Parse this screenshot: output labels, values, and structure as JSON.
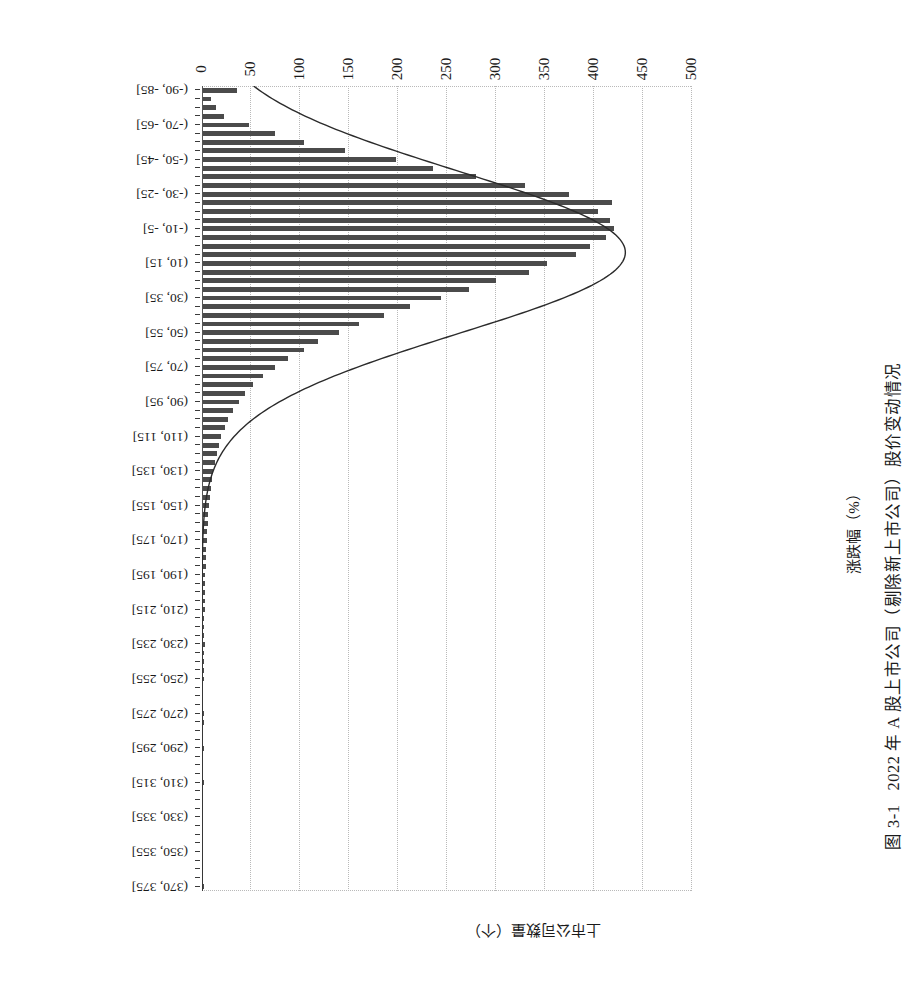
{
  "caption": {
    "number": "图 3-1",
    "text": "2022 年 A 股上市公司（剔除新上市公司）股价变动情况"
  },
  "axes": {
    "value_axis_title": "上市公司数量（个）",
    "category_axis_title": "涨跌幅（%）"
  },
  "chart_data": {
    "type": "bar",
    "orientation": "horizontal-rotated-180",
    "title": "2022 年 A 股上市公司（剔除新上市公司）股价变动情况",
    "xlabel": "涨跌幅（%）",
    "ylabel": "上市公司数量（个）",
    "ylim": [
      0,
      500
    ],
    "yticks": [
      0,
      50,
      100,
      150,
      200,
      250,
      300,
      350,
      400,
      450,
      500
    ],
    "grid": true,
    "legend": null,
    "overlay_curve": "normal distribution fit",
    "categories": [
      "(-90, -85]",
      "(-85, -80]",
      "(-80, -75]",
      "(-75, -70]",
      "(-70, -65]",
      "(-65, -60]",
      "(-60, -55]",
      "(-55, -50]",
      "(-50, -45]",
      "(-45, -40]",
      "(-40, -35]",
      "(-35, -30]",
      "(-30, -25]",
      "(-25, -20]",
      "(-20, -15]",
      "(-15, -10]",
      "(-10, -5]",
      "(-5, 0]",
      "(0, 5]",
      "(5, 10]",
      "(10, 15]",
      "(15, 20]",
      "(20, 25]",
      "(25, 30]",
      "(30, 35]",
      "(35, 40]",
      "(40, 45]",
      "(45, 50]",
      "(50, 55]",
      "(55, 60]",
      "(60, 65]",
      "(65, 70]",
      "(70, 75]",
      "(75, 80]",
      "(80, 85]",
      "(85, 90]",
      "(90, 95]",
      "(95, 100]",
      "(100, 105]",
      "(105, 110]",
      "(110, 115]",
      "(115, 120]",
      "(120, 125]",
      "(125, 130]",
      "(130, 135]",
      "(135, 140]",
      "(140, 145]",
      "(145, 150]",
      "(150, 155]",
      "(155, 160]",
      "(160, 165]",
      "(165, 170]",
      "(170, 175]",
      "(175, 180]",
      "(180, 185]",
      "(185, 190]",
      "(190, 195]",
      "(195, 200]",
      "(200, 205]",
      "(205, 210]",
      "(210, 215]",
      "(215, 220]",
      "(220, 225]",
      "(225, 230]",
      "(230, 235]",
      "(235, 240]",
      "(240, 245]",
      "(245, 250]",
      "(250, 255]",
      "(255, 260]",
      "(260, 265]",
      "(265, 270]",
      "(270, 275]",
      "(275, 280]",
      "(280, 285]",
      "(285, 290]",
      "(290, 295]",
      "(295, 300]",
      "(300, 305]",
      "(305, 310]",
      "(310, 315]",
      "(315, 320]",
      "(320, 325]",
      "(325, 330]",
      "(330, 335]",
      "(335, 340]",
      "(340, 345]",
      "(345, 350]",
      "(350, 355]",
      "(355, 360]",
      "(360, 365]",
      "(365, 370]",
      "(370, 375]"
    ],
    "displayed_category_ticks": [
      "(-90, -85]",
      "(-70, -65]",
      "(-50, -45]",
      "(-30, -25]",
      "(-10, -5]",
      "(10, 15]",
      "(30, 35]",
      "(50, 55]",
      "(70, 75]",
      "(90, 95]",
      "(110, 115]",
      "(130, 135]",
      "(150, 155]",
      "(170, 175]",
      "(190, 195]",
      "(210, 215]",
      "(230, 235]",
      "(250, 255]",
      "(270, 275]",
      "(290, 295]",
      "(310, 315]",
      "(330, 335]",
      "(350, 355]",
      "(370, 375]"
    ],
    "values": [
      36,
      9,
      14,
      22,
      48,
      74,
      104,
      146,
      198,
      236,
      280,
      330,
      374,
      418,
      404,
      416,
      420,
      412,
      396,
      382,
      352,
      334,
      300,
      272,
      244,
      212,
      186,
      160,
      140,
      118,
      104,
      88,
      74,
      62,
      52,
      44,
      38,
      32,
      27,
      23,
      19,
      17,
      15,
      13,
      11,
      10,
      9,
      8,
      7,
      6,
      6,
      5,
      5,
      4,
      4,
      4,
      3,
      3,
      3,
      3,
      3,
      2,
      2,
      2,
      3,
      2,
      2,
      2,
      2,
      1,
      1,
      1,
      2,
      2,
      1,
      1,
      2,
      1,
      1,
      1,
      2,
      1,
      1,
      1,
      1,
      1,
      1,
      1,
      1,
      1,
      1,
      1,
      2
    ],
    "curve_label": "normal fit",
    "curve_peak_value": 432
  }
}
